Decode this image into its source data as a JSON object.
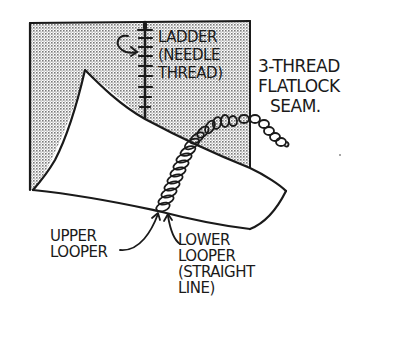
{
  "diagram": {
    "title_lines": [
      "3-THREAD",
      "FLATLOCK",
      "SEAM."
    ],
    "labels": {
      "ladder": [
        "LADDER",
        "(NEEDLE",
        "THREAD)"
      ],
      "upper_looper": [
        "UPPER",
        "LOOPER"
      ],
      "lower_looper": [
        "LOWER",
        "LOOPER",
        "(STRAIGHT",
        "LINE)"
      ]
    },
    "colors": {
      "ink": "#1a1a1a",
      "fabric_shade": "#c8c8c8",
      "background": "#ffffff"
    }
  }
}
